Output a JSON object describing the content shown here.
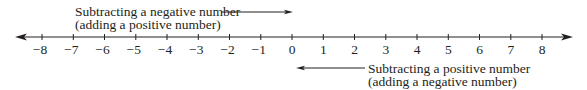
{
  "diagram": {
    "type": "number-line",
    "min": -8,
    "max": 8,
    "ticks": [
      "−8",
      "−7",
      "−6",
      "−5",
      "−4",
      "−3",
      "−2",
      "−1",
      "0",
      "1",
      "2",
      "3",
      "4",
      "5",
      "6",
      "7",
      "8"
    ],
    "arrows_both_ends": true,
    "annotations": [
      {
        "id": "top",
        "line1": "Subtracting a negative number",
        "line2": "(adding a positive number)",
        "arrow_direction": "right",
        "arrow_points_to": "0"
      },
      {
        "id": "bottom",
        "line1": "Subtracting a positive number",
        "line2": "(adding a negative number)",
        "arrow_direction": "left",
        "arrow_starts_at": "0"
      }
    ],
    "colors": {
      "ink": "#231f20",
      "background": "#ffffff"
    }
  }
}
